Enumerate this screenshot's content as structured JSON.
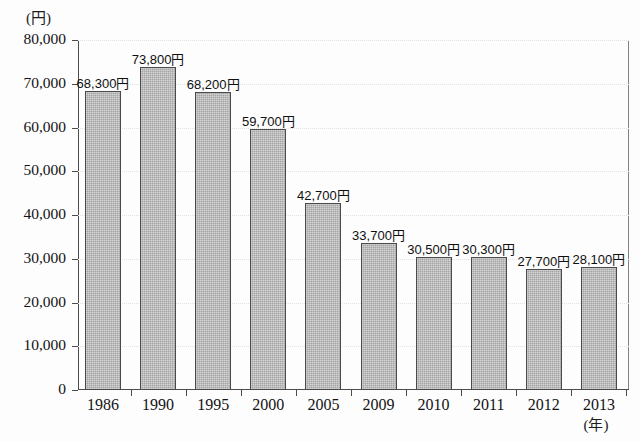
{
  "chart_data": {
    "type": "bar",
    "title": "",
    "subtitle": "",
    "xlabel": "(年)",
    "ylabel": "(円)",
    "ylim": [
      0,
      80000
    ],
    "ytick_labels": [
      "80,000",
      "70,000",
      "60,000",
      "50,000",
      "40,000",
      "30,000",
      "20,000",
      "10,000",
      "0"
    ],
    "ytick_values": [
      80000,
      70000,
      60000,
      50000,
      40000,
      30000,
      20000,
      10000,
      0
    ],
    "grid": true,
    "legend": "none",
    "categories": [
      "1986",
      "1990",
      "1995",
      "2000",
      "2005",
      "2009",
      "2010",
      "2011",
      "2012",
      "2013"
    ],
    "values": [
      68300,
      73800,
      68200,
      59700,
      42700,
      33700,
      30500,
      30300,
      27700,
      28100
    ],
    "data_labels": [
      "68,300円",
      "73,800円",
      "68,200円",
      "59,700円",
      "42,700円",
      "33,700円",
      "30,500円",
      "30,300円",
      "27,700円",
      "28,100円"
    ],
    "bar_color": "#ababab",
    "bar_edge_color": "#4a4a4a",
    "grid_color": "#e2e2e2",
    "axis_color": "#4c4c4c",
    "text_color": "#131313"
  }
}
